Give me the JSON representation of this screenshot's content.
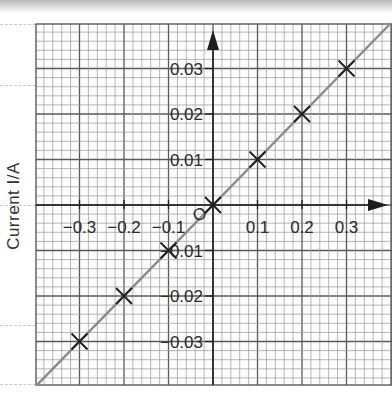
{
  "chart_data": {
    "type": "scatter",
    "title": "",
    "xlabel": "",
    "ylabel": "Current I/A",
    "x_ticks": [
      "-0.3",
      "-0.2",
      "-0.1",
      "0",
      "0.1",
      "0.2",
      "0.3"
    ],
    "y_ticks": [
      "-0.03",
      "-0.02",
      "-0.01",
      "0",
      "0.01",
      "0.02",
      "0.03"
    ],
    "x_tick_labels_shown": [
      "-0.3",
      "-0.2",
      "-0.1",
      "0.1",
      "0.2",
      "0.3"
    ],
    "y_tick_labels_shown": [
      "0.03",
      "0.02",
      "0.01",
      "-0.01",
      "-0.02",
      "-0.03"
    ],
    "origin_label": "O",
    "xlim": [
      -0.37,
      0.4
    ],
    "ylim": [
      -0.04,
      0.031
    ],
    "grid": true,
    "series": [
      {
        "name": "measurements",
        "marker": "x",
        "x": [
          -0.3,
          -0.2,
          -0.1,
          0.0,
          0.1,
          0.2,
          0.3
        ],
        "y": [
          -0.03,
          -0.02,
          -0.01,
          0.0,
          0.01,
          0.02,
          0.03
        ]
      }
    ],
    "best_fit_line": {
      "slope": 0.1,
      "intercept": 0.0,
      "color": "#8a8a8a"
    },
    "colors": {
      "grid_minor": "#9a9a9a",
      "grid_major": "#5a5a5a",
      "axis": "#1e1e1e",
      "marker": "#222222",
      "line": "#8a8a8a"
    }
  }
}
